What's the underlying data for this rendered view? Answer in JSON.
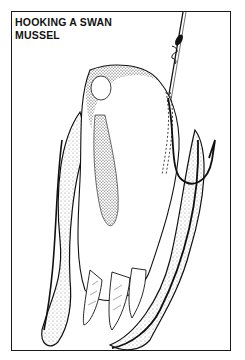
{
  "figure": {
    "title_line1": "HOOKING A SWAN",
    "title_line2": "MUSSEL",
    "illustration": "swan-mussel-on-hook-stipple-drawing",
    "colors": {
      "ink": "#111111",
      "paper": "#ffffff"
    }
  }
}
